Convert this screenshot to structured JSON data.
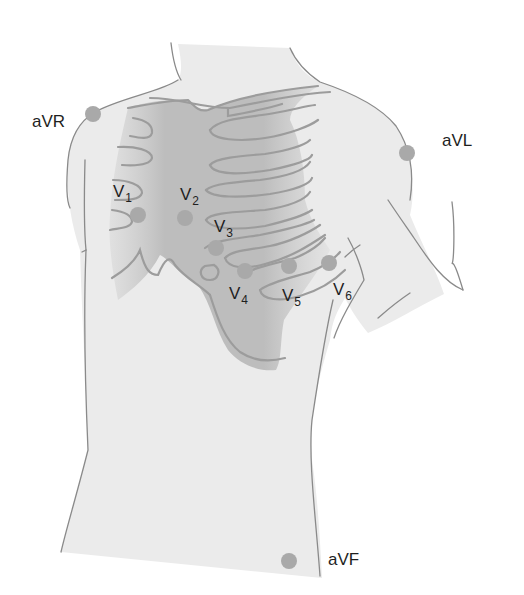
{
  "figure": {
    "colors": {
      "background": "#ffffff",
      "body_fill": "#ebebeb",
      "rib_shade": "#bdbdbd",
      "outline": "#8a8a8a",
      "rib_line": "#9c9c9c",
      "electrode": "#a9a9a9",
      "label_text": "#1f1f1f"
    },
    "electrodes": {
      "aVR": {
        "label": "aVR",
        "x": 93,
        "y": 114
      },
      "aVL": {
        "label": "aVL",
        "x": 407,
        "y": 153
      },
      "V1": {
        "label": "V",
        "sub": "1",
        "x": 138,
        "y": 215
      },
      "V2": {
        "label": "V",
        "sub": "2",
        "x": 185,
        "y": 218
      },
      "V3": {
        "label": "V",
        "sub": "3",
        "x": 216,
        "y": 248
      },
      "V4": {
        "label": "V",
        "sub": "4",
        "x": 245,
        "y": 271
      },
      "V5": {
        "label": "V",
        "sub": "5",
        "x": 289,
        "y": 266
      },
      "V6": {
        "label": "V",
        "sub": "6",
        "x": 329,
        "y": 263
      },
      "aVF": {
        "label": "aVF",
        "x": 289,
        "y": 561
      }
    }
  }
}
